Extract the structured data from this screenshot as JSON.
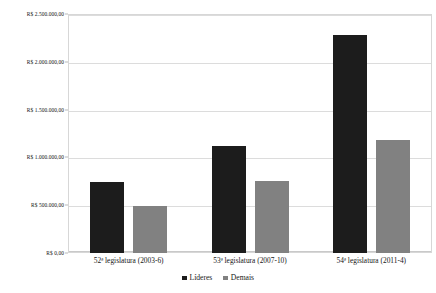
{
  "chart_data": {
    "type": "bar",
    "title": "",
    "subtitle": "",
    "xlabel": "",
    "ylabel": "",
    "categories": [
      "52ª legislatura (2003-6)",
      "53ª legislatura (2007-10)",
      "54ª legislatura (2011-4)"
    ],
    "series": [
      {
        "name": "Líderes",
        "color": "#1c1c1c",
        "values": [
          740000,
          1120000,
          2280000
        ]
      },
      {
        "name": "Demais",
        "color": "#818181",
        "values": [
          495000,
          750000,
          1180000
        ]
      }
    ],
    "ylim": [
      0,
      2500000
    ],
    "ytick_values": [
      2500000,
      2000000,
      1500000,
      1000000,
      500000,
      0
    ],
    "ytick_labels": [
      "R$ 2.500.000,00",
      "R$ 2.000.000,00",
      "R$ 1.500.000,00",
      "R$ 1.000.000,00",
      "R$ 500.000,00",
      "R$ 0,00"
    ],
    "grid": true,
    "legend_position": "bottom",
    "currency_symbol": "R$"
  },
  "legend": {
    "entries": [
      {
        "label": "Líderes"
      },
      {
        "label": "Demais"
      }
    ]
  }
}
